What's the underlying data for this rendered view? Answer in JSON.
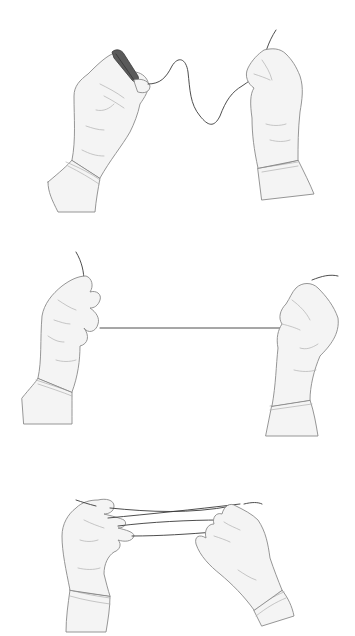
{
  "figure": {
    "panels": [
      {
        "id": 1,
        "label": "Step 1",
        "content": "left hand holds wound thread coil on fingers, slack wavy thread leads to right hand pinching thread"
      },
      {
        "id": 2,
        "label": "Step 2",
        "content": "both hands hold thread pulled taut horizontally"
      },
      {
        "id": 3,
        "label": "Step 3",
        "content": "thread wrapped across fingers of both hands, forming crossed strands"
      }
    ],
    "colors": {
      "background": "#ffffff",
      "glove_fill": "#f4f4f4",
      "outline": "#8a8a8a",
      "thread": "#3a3a3a"
    }
  }
}
